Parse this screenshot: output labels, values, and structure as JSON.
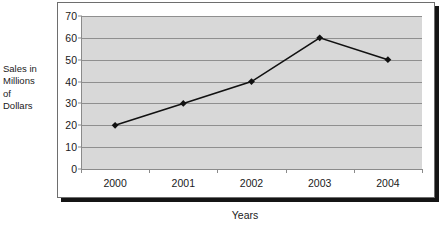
{
  "chart_data": {
    "type": "line",
    "title": "",
    "categories": [
      "2000",
      "2001",
      "2002",
      "2003",
      "2004"
    ],
    "values": [
      20,
      30,
      40,
      60,
      50
    ],
    "series": [
      {
        "name": "Sales",
        "values": [
          20,
          30,
          40,
          60,
          50
        ]
      }
    ],
    "xlabel": "Years",
    "ylabel": "Sales in Millions of Dollars",
    "ylabel_lines": [
      "Sales in",
      "Millions",
      "of",
      "Dollars"
    ],
    "ylim": [
      0,
      70
    ],
    "ytick_step": 10,
    "yticks": [
      "0",
      "10",
      "20",
      "30",
      "40",
      "50",
      "60",
      "70"
    ],
    "grid": "horizontal",
    "legend": "none",
    "marker": "diamond",
    "colors": {
      "line": "#111111",
      "marker": "#111111",
      "plot_background": "#d8d8d8",
      "gridline": "#8f8f8f",
      "axis": "#8a8a8a",
      "frame_border": "#6e6e6e",
      "frame_shadow": "#151515",
      "text": "#1a1a1a",
      "page_background": "#ffffff"
    }
  }
}
